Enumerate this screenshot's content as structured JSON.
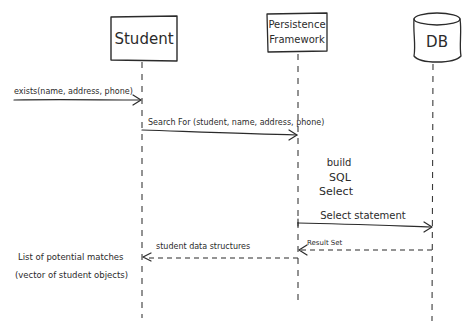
{
  "diagram": {
    "type": "sequence-diagram",
    "style": "hand-drawn",
    "participants": [
      {
        "id": "student",
        "label": "Student",
        "shape": "box"
      },
      {
        "id": "persistence",
        "label_line1": "Persistence",
        "label_line2": "Framework",
        "shape": "box"
      },
      {
        "id": "db",
        "label": "DB",
        "shape": "cylinder"
      }
    ],
    "messages": [
      {
        "id": "m1",
        "from": "external",
        "to": "student",
        "label": "exists(name, address, phone)",
        "kind": "call"
      },
      {
        "id": "m2",
        "from": "student",
        "to": "persistence",
        "label": "Search For (student, name, address, phone)",
        "kind": "call"
      },
      {
        "id": "m3",
        "from": "persistence",
        "to": "db",
        "label": "Select statement",
        "kind": "call"
      },
      {
        "id": "m4",
        "from": "db",
        "to": "persistence",
        "label": "Result Set",
        "kind": "return"
      },
      {
        "id": "m5",
        "from": "persistence",
        "to": "student",
        "label": "student data structures",
        "kind": "return"
      }
    ],
    "notes": {
      "build_sql": {
        "line1": "build",
        "line2": "SQL",
        "line3": "Select"
      },
      "result_note": {
        "line1": "List of potential matches",
        "line2": "(vector of student objects)"
      }
    }
  }
}
